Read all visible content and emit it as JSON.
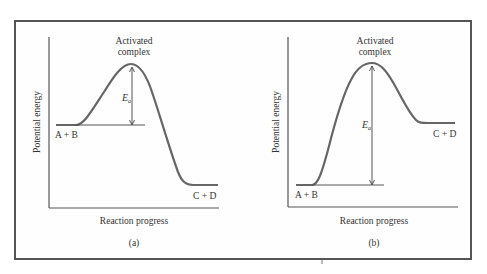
{
  "figure": {
    "panels": [
      {
        "id": "a",
        "caption": "(a)",
        "y_axis_label": "Potential energy",
        "x_axis_label": "Reaction progress",
        "peak_label_line1": "Activated",
        "peak_label_line2": "complex",
        "reactants_label": "A + B",
        "products_label": "C + D",
        "energy_label": "E",
        "energy_subscript": "a",
        "type": "exothermic"
      },
      {
        "id": "b",
        "caption": "(b)",
        "y_axis_label": "Potential energy",
        "x_axis_label": "Reaction progress",
        "peak_label_line1": "Activated",
        "peak_label_line2": "complex",
        "reactants_label": "A + B",
        "products_label": "C + D",
        "energy_label": "E",
        "energy_subscript": "a",
        "type": "endothermic"
      }
    ],
    "colors": {
      "curve": "#666666",
      "axis": "#555555",
      "text": "#333333",
      "frame": "#555555"
    }
  }
}
